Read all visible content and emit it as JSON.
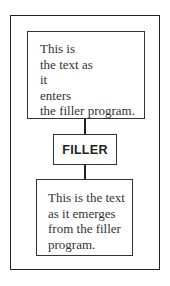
{
  "diagram": {
    "input_box": {
      "lines": [
        "This is",
        "the text as",
        "it",
        "enters",
        "the filler program."
      ]
    },
    "process_box": {
      "label": "FILLER"
    },
    "output_box": {
      "lines": [
        "This is the text",
        "as it emerges",
        "from the filler",
        "program."
      ]
    },
    "edges": [
      {
        "from": "input_box",
        "to": "process_box"
      },
      {
        "from": "process_box",
        "to": "output_box"
      }
    ]
  }
}
